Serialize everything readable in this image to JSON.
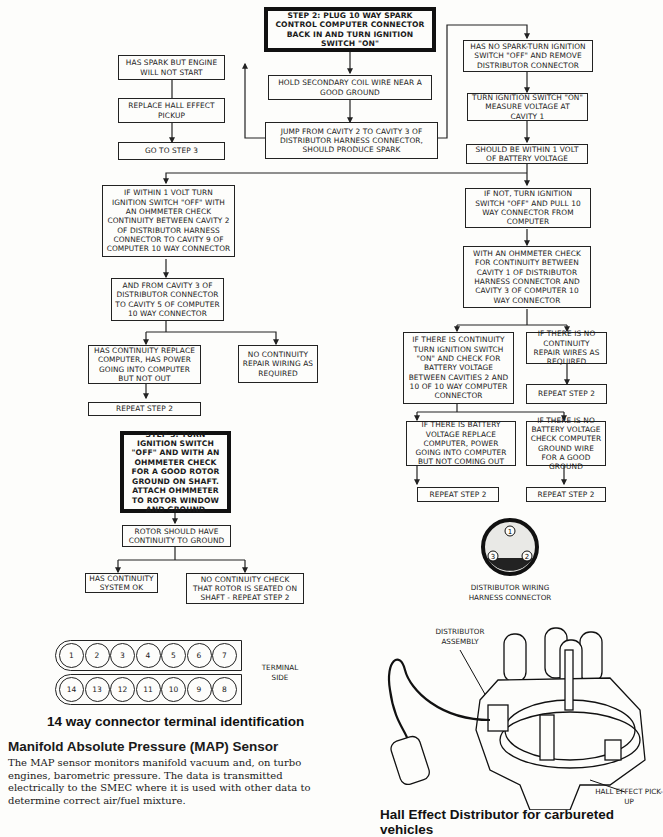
{
  "flowchart": {
    "step2": "STEP 2: PLUG 10 WAY SPARK CONTROL COMPUTER CONNECTOR BACK IN AND TURN IGNITION SWITCH \"ON\"",
    "has_spark": "HAS SPARK BUT ENGINE WILL NOT START",
    "replace_hall": "REPLACE HALL EFFECT PICKUP",
    "goto_step3": "GO TO STEP 3",
    "hold_coil": "HOLD SECONDARY COIL WIRE NEAR A GOOD GROUND",
    "jump_cavity": "JUMP FROM CAVITY 2 TO CAVITY 3 OF DISTRIBUTOR HARNESS CONNECTOR, SHOULD PRODUCE SPARK",
    "no_spark": "HAS NO SPARK-TURN IGNITION SWITCH \"OFF\" AND REMOVE DISTRIBUTOR CONNECTOR",
    "measure_voltage": "TURN IGNITION SWITCH \"ON\" MEASURE VOLTAGE AT CAVITY 1",
    "within_1v": "SHOULD BE WITHIN 1 VOLT OF BATTERY VOLTAGE",
    "if_within": "IF WITHIN 1 VOLT TURN IGNITION SWITCH \"OFF\" WITH AN OHMMETER CHECK CONTINUITY BETWEEN CAVITY 2 OF DISTRIBUTOR HARNESS CONNECTOR TO CAVITY 9 OF COMPUTER 10 WAY CONNECTOR",
    "and_from_cavity3": "AND FROM CAVITY 3 OF DISTRIBUTOR CONNECTOR TO CAVITY 5 OF COMPUTER 10 WAY CONNECTOR",
    "has_continuity_replace": "HAS CONTINUITY REPLACE COMPUTER, HAS POWER GOING INTO COMPUTER BUT NOT OUT",
    "no_continuity_repair": "NO CONTINUITY REPAIR WIRING AS REQUIRED",
    "repeat_left": "REPEAT STEP 2",
    "if_not": "IF NOT, TURN IGNITION SWITCH \"OFF\" AND PULL 10 WAY CONNECTOR FROM COMPUTER",
    "ohmmeter_cavity1": "WITH AN OHMMETER CHECK FOR CONTINUITY BETWEEN CAVITY 1 OF DISTRIBUTOR HARNESS CONNECTOR AND CAVITY 3 OF COMPUTER 10 WAY CONNECTOR",
    "if_continuity": "IF THERE IS CONTINUITY TURN IGNITION SWITCH \"ON\" AND CHECK FOR BATTERY VOLTAGE BETWEEN CAVITIES 2 AND 10 OF 10 WAY COMPUTER CONNECTOR",
    "if_no_continuity": "IF THERE IS NO CONTINUITY REPAIR WIRES AS REQUIRED",
    "repeat_r1": "REPEAT STEP 2",
    "if_battery": "IF THERE IS BATTERY VOLTAGE REPLACE COMPUTER, POWER GOING INTO COMPUTER BUT NOT COMING OUT",
    "if_no_battery": "IF THERE IS NO BATTERY VOLTAGE CHECK COMPUTER GROUND WIRE FOR A GOOD GROUND",
    "repeat_r2": "REPEAT STEP 2",
    "repeat_r3": "REPEAT STEP 2",
    "step3": "STEP 3: TURN IGNITION SWITCH \"OFF\" AND WITH AN OHMMETER CHECK FOR A GOOD ROTOR GROUND ON SHAFT. ATTACH OHMMETER TO ROTOR WINDOW AND GROUND",
    "rotor_continuity": "ROTOR SHOULD HAVE CONTINUITY TO GROUND",
    "system_ok": "HAS CONTINUITY SYSTEM OK",
    "no_continuity_rotor": "NO CONTINUITY CHECK THAT ROTOR IS SEATED ON SHAFT - REPEAT STEP 2"
  },
  "connector14": {
    "top_row": [
      "1",
      "2",
      "3",
      "4",
      "5",
      "6",
      "7"
    ],
    "bottom_row": [
      "14",
      "13",
      "12",
      "11",
      "10",
      "9",
      "8"
    ],
    "side_label": "TERMINAL SIDE",
    "caption": "14 way connector terminal identification"
  },
  "dist_connector": {
    "pins": [
      "1",
      "2",
      "3"
    ],
    "label": "DISTRIBUTOR WIRING HARNESS CONNECTOR"
  },
  "distributor_figure": {
    "assembly_label": "DISTRIBUTOR ASSEMBLY",
    "pickup_label": "HALL EFFECT PICK-UP",
    "caption": "Hall Effect Distributor for carbureted vehicles"
  },
  "map_section": {
    "heading": "Manifold Absolute Pressure (MAP) Sensor",
    "body": "The MAP sensor monitors manifold vacuum and, on turbo engines, barometric pressure. The data is transmitted electrically to the SMEC where it is used with other data to determine correct air/fuel mixture."
  }
}
